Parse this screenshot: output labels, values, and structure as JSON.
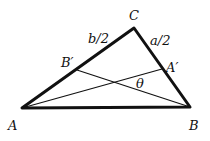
{
  "diagram": {
    "vertices": {
      "A": {
        "label": "A",
        "x": 22,
        "y": 108
      },
      "B": {
        "label": "B",
        "x": 190,
        "y": 107
      },
      "C": {
        "label": "C",
        "x": 134,
        "y": 28
      }
    },
    "midpoints": {
      "A_prime": {
        "label": "A′",
        "x": 162,
        "y": 69
      },
      "B_prime": {
        "label": "B′",
        "x": 77,
        "y": 70
      }
    },
    "side_labels": {
      "b_half": "b/2",
      "a_half": "a/2"
    },
    "angle_label": "θ",
    "colors": {
      "stroke": "#111111",
      "background": "#ffffff"
    }
  }
}
